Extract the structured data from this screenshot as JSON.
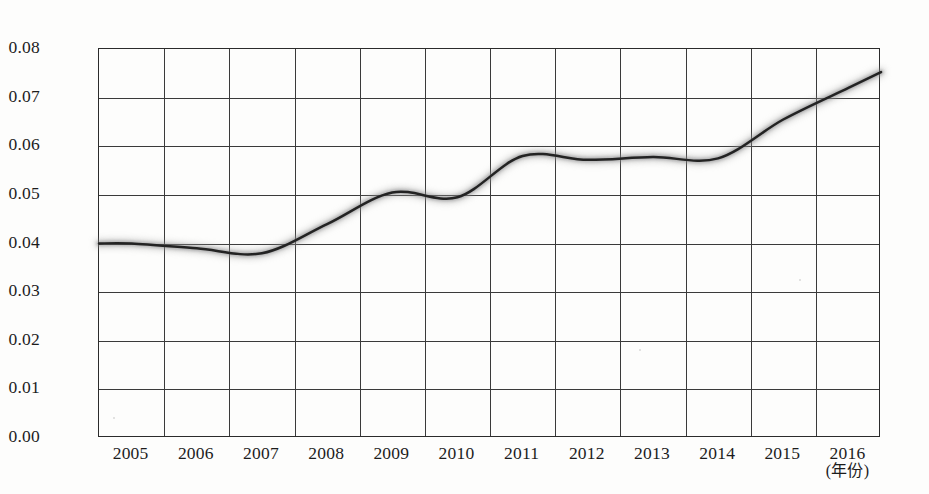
{
  "chart_data": {
    "type": "line",
    "title": "",
    "xlabel": "(年份)",
    "ylabel": "",
    "categories": [
      "2005",
      "2006",
      "2007",
      "2008",
      "2009",
      "2010",
      "2011",
      "2012",
      "2013",
      "2014",
      "2015",
      "2016"
    ],
    "values": [
      0.04,
      0.039,
      0.038,
      0.044,
      0.0505,
      0.0495,
      0.058,
      0.0572,
      0.0578,
      0.0575,
      0.0655,
      0.072
    ],
    "series": [
      {
        "name": "",
        "values": [
          0.04,
          0.039,
          0.038,
          0.044,
          0.0505,
          0.0495,
          0.058,
          0.0572,
          0.0578,
          0.0575,
          0.0655,
          0.072
        ]
      }
    ],
    "ylim": [
      0.0,
      0.08
    ],
    "ytick_labels": [
      "0.00",
      "0.01",
      "0.02",
      "0.03",
      "0.04",
      "0.05",
      "0.06",
      "0.07",
      "0.08"
    ],
    "ytick_values": [
      0.0,
      0.01,
      0.02,
      0.03,
      0.04,
      0.05,
      0.06,
      0.07,
      0.08
    ],
    "xtick_labels": [
      "2005",
      "2006",
      "2007",
      "2008",
      "2009",
      "2010",
      "2011",
      "2012",
      "2013",
      "2014",
      "2015",
      "2016"
    ],
    "grid": true,
    "legend": null,
    "legend_position": "none",
    "line_color": "#232323",
    "grid_color": "#3a3a3a",
    "axis_color": "#2b2b2b",
    "background_color": "#fdfdfc",
    "annotations": []
  },
  "axis": {
    "x_unit_label": "(年份)"
  }
}
